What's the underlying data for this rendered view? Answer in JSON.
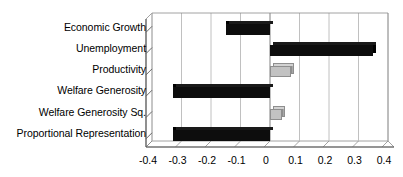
{
  "chart_data": {
    "type": "bar",
    "orientation": "horizontal",
    "title": "",
    "subtitle": "",
    "xlabel": "",
    "ylabel": "",
    "categories": [
      "Economic Growth",
      "Unemployment",
      "Productivity",
      "Welfare Generosity",
      "Welfare Generosity Sq.",
      "Proportional Representation"
    ],
    "values": [
      -0.15,
      0.35,
      0.07,
      -0.33,
      0.04,
      -0.33
    ],
    "bar_colors": [
      "#0d0d0d",
      "#0d0d0d",
      "#c2c2c2",
      "#0d0d0d",
      "#c2c2c2",
      "#0d0d0d"
    ],
    "xlim": [
      -0.4,
      0.4
    ],
    "xticks": [
      -0.4,
      -0.3,
      -0.2,
      -0.1,
      0,
      0.1,
      0.2,
      0.3,
      0.4
    ],
    "xtick_labels": [
      "-0.4",
      "-0.3",
      "-0.2",
      "-0.1",
      "0",
      "0.1",
      "0.2",
      "0.3",
      "0.4"
    ],
    "grid": true,
    "grid_axis": "x",
    "legend": false,
    "style": "3d-perspective",
    "series": [
      {
        "name": "coefficient",
        "values": [
          -0.15,
          0.35,
          0.07,
          -0.33,
          0.04,
          -0.33
        ]
      }
    ]
  },
  "colors": {
    "bar_dark": "#0d0d0d",
    "bar_light": "#c2c2c2",
    "bar_light_edge": "#8e8e8e",
    "gridline": "#b4b4b4",
    "axis": "#666666",
    "zero_line": "#8c8c8c",
    "background": "#ffffff",
    "text": "#000000"
  }
}
